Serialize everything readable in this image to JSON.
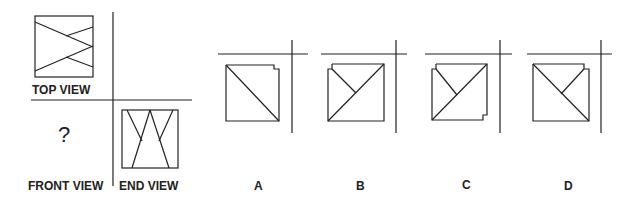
{
  "labels": {
    "top_view": "TOP VIEW",
    "front_view": "FRONT VIEW",
    "end_view": "END VIEW",
    "question_mark": "?"
  },
  "options": [
    {
      "label": "A"
    },
    {
      "label": "B"
    },
    {
      "label": "C"
    },
    {
      "label": "D"
    }
  ],
  "colors": {
    "line": "#222222",
    "background": "#ffffff"
  }
}
